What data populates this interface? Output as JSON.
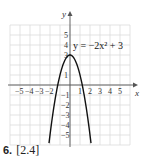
{
  "chart_data": {
    "type": "line",
    "title": "",
    "equation_label": "y = −2x² + 3",
    "xlabel": "x",
    "ylabel": "y",
    "xlim": [
      -6,
      6
    ],
    "ylim": [
      -6,
      6
    ],
    "x_ticks": [
      -5,
      -4,
      -3,
      -2,
      1,
      2,
      3,
      4,
      5
    ],
    "x_tick_labels": [
      "−5",
      "−4",
      "−3",
      "−2",
      "1",
      "2",
      "3",
      "4",
      "5"
    ],
    "y_ticks": [
      5,
      4,
      3,
      1,
      -1,
      -2,
      -3,
      -4,
      -5
    ],
    "y_tick_labels": [
      "5",
      "4",
      "3",
      "1",
      "−1",
      "−2",
      "−3",
      "−4",
      "−5"
    ],
    "grid": true,
    "series": [
      {
        "name": "y = -2x^2 + 3",
        "function": "-2*x*x+3",
        "x": [
          -2.1,
          -1.5,
          -1,
          -0.5,
          0,
          0.5,
          1,
          1.5,
          2.1
        ],
        "y": [
          -5.82,
          -1.5,
          1,
          2.5,
          3,
          2.5,
          1,
          -1.5,
          -5.82
        ]
      }
    ]
  },
  "caption": {
    "number": "6.",
    "text": "[2.4]"
  }
}
